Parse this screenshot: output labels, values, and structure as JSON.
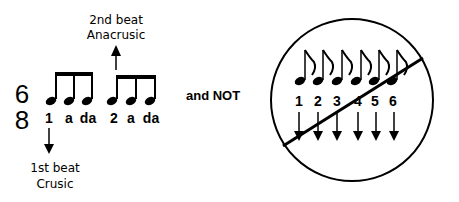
{
  "time_signature": {
    "top": "6",
    "bottom": "8"
  },
  "left_group": {
    "counts": [
      "1",
      "a",
      "da",
      "2",
      "a",
      "da"
    ],
    "beat2_label": [
      "2nd beat",
      "Anacrusic"
    ],
    "beat1_label": [
      "1st beat",
      "Crusic"
    ]
  },
  "connector_text": "and NOT",
  "right_group": {
    "counts": [
      "1",
      "2",
      "3",
      "4",
      "5",
      "6"
    ],
    "note_count": 6,
    "crossed_out": true
  }
}
